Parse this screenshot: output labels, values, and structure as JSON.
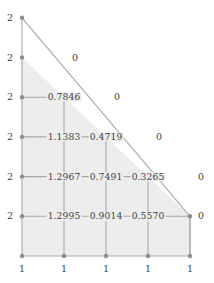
{
  "figure": {
    "colors": {
      "fill": "#ededed",
      "grid_line": "#a8a8a8",
      "hypotenuse": "#a8a8a8",
      "node": "#8d8d8d",
      "text": "#3f3f3f",
      "background": "#ffffff"
    },
    "geometry": {
      "origin_x": 22,
      "origin_y": 256,
      "dx": 42,
      "dy": 39.7,
      "columns": 5,
      "rows": 7
    }
  },
  "chart_data": {
    "type": "scatter",
    "title": "",
    "xlabel": "",
    "ylabel": "",
    "grid": true,
    "legend": null,
    "x": [
      0,
      1,
      2,
      3,
      4
    ],
    "y": [
      0,
      1,
      2,
      3,
      4,
      5,
      6
    ],
    "boundary_left_label": "2",
    "boundary_bottom_label": "1",
    "boundary_hypotenuse_label": "0",
    "nodes": [
      {
        "col": 0,
        "row": 6,
        "label": "2",
        "kind": "left-boundary"
      },
      {
        "col": 0,
        "row": 5,
        "label": "2",
        "kind": "left-boundary"
      },
      {
        "col": 1,
        "row": 5,
        "label": "0",
        "kind": "hypotenuse"
      },
      {
        "col": 0,
        "row": 4,
        "label": "2",
        "kind": "left-boundary"
      },
      {
        "col": 1,
        "row": 4,
        "label": "0.7846",
        "kind": "interior"
      },
      {
        "col": 2,
        "row": 4,
        "label": "0",
        "kind": "hypotenuse"
      },
      {
        "col": 0,
        "row": 3,
        "label": "2",
        "kind": "left-boundary"
      },
      {
        "col": 1,
        "row": 3,
        "label": "1.1383",
        "kind": "interior"
      },
      {
        "col": 2,
        "row": 3,
        "label": "0.4719",
        "kind": "interior"
      },
      {
        "col": 3,
        "row": 3,
        "label": "0",
        "kind": "hypotenuse"
      },
      {
        "col": 0,
        "row": 2,
        "label": "2",
        "kind": "left-boundary"
      },
      {
        "col": 1,
        "row": 2,
        "label": "1.2967",
        "kind": "interior"
      },
      {
        "col": 2,
        "row": 2,
        "label": "0.7491",
        "kind": "interior"
      },
      {
        "col": 3,
        "row": 2,
        "label": "0.3265",
        "kind": "interior"
      },
      {
        "col": 4,
        "row": 2,
        "label": "0",
        "kind": "hypotenuse"
      },
      {
        "col": 0,
        "row": 1,
        "label": "2",
        "kind": "left-boundary"
      },
      {
        "col": 1,
        "row": 1,
        "label": "1.2995",
        "kind": "interior"
      },
      {
        "col": 2,
        "row": 1,
        "label": "0.9014",
        "kind": "interior"
      },
      {
        "col": 3,
        "row": 1,
        "label": "0.5570",
        "kind": "interior"
      },
      {
        "col": 4,
        "row": 1,
        "label": "0",
        "kind": "right-boundary"
      },
      {
        "col": 0,
        "row": 0,
        "label": "1",
        "kind": "bottom-boundary"
      },
      {
        "col": 1,
        "row": 0,
        "label": "1",
        "kind": "bottom-boundary"
      },
      {
        "col": 2,
        "row": 0,
        "label": "1",
        "kind": "bottom-boundary"
      },
      {
        "col": 3,
        "row": 0,
        "label": "1",
        "kind": "bottom-boundary"
      },
      {
        "col": 4,
        "row": 0,
        "label": "1",
        "kind": "bottom-boundary"
      }
    ],
    "labels_left": [
      "2",
      "2",
      "2",
      "2",
      "2",
      "2"
    ],
    "labels_bottom": [
      "1",
      "1",
      "1",
      "1",
      "1"
    ],
    "labels_zero": [
      "0",
      "0",
      "0",
      "0",
      "0"
    ],
    "values_row_1": [
      "1.2995",
      "0.9014",
      "0.5570"
    ],
    "values_row_2": [
      "1.2967",
      "0.7491",
      "0.3265"
    ],
    "values_row_3": [
      "1.1383",
      "0.4719"
    ],
    "values_row_4": [
      "0.7846"
    ]
  }
}
